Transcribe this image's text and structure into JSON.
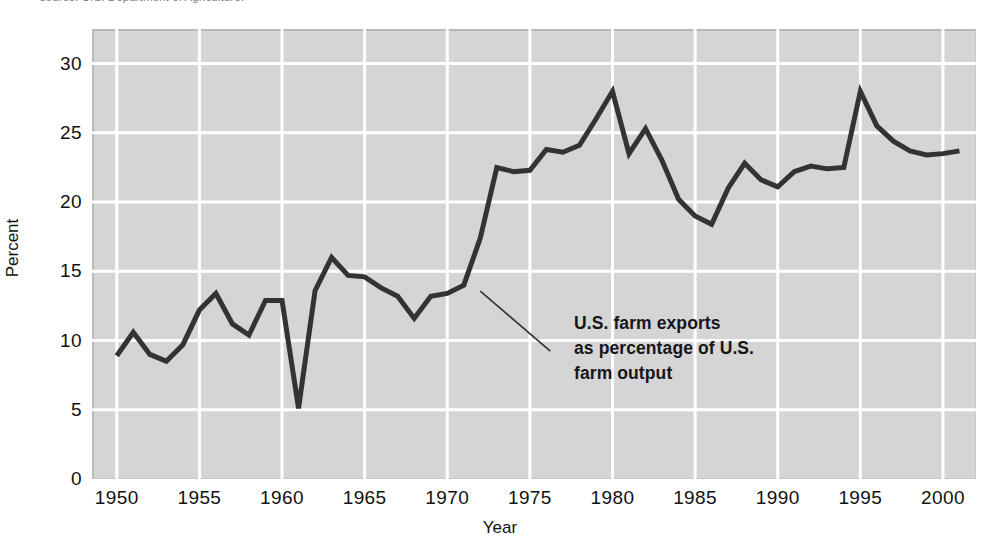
{
  "figure": {
    "caption_fragment": "source: U.S. Department of Agriculture."
  },
  "axes": {
    "y_title": "Percent",
    "x_title": "Year",
    "y_ticks": [
      "0",
      "5",
      "10",
      "15",
      "20",
      "25",
      "30"
    ],
    "x_ticks": [
      "1950",
      "1955",
      "1960",
      "1965",
      "1970",
      "1975",
      "1980",
      "1985",
      "1990",
      "1995",
      "2000"
    ]
  },
  "annotation": {
    "line1": "U.S. farm exports",
    "line2": "as percentage of U.S.",
    "line3": "farm output"
  },
  "style": {
    "plot_background": "#d5d5d5",
    "gridline_color": "#ffffff",
    "series_color": "#333333",
    "text_color": "#111111"
  },
  "chart_data": {
    "type": "line",
    "title": "U.S. farm exports as percentage of U.S. farm output",
    "xlabel": "Year",
    "ylabel": "Percent",
    "xlim": [
      1948.5,
      2002.0
    ],
    "ylim": [
      0,
      32.5
    ],
    "yticks": [
      0,
      5,
      10,
      15,
      20,
      25,
      30
    ],
    "xticks": [
      1950,
      1955,
      1960,
      1965,
      1970,
      1975,
      1980,
      1985,
      1990,
      1995,
      2000
    ],
    "grid": true,
    "legend": null,
    "series": [
      {
        "name": "U.S. farm exports as percentage of U.S. farm output",
        "color": "#333333",
        "x": [
          1950,
          1951,
          1952,
          1953,
          1954,
          1955,
          1956,
          1957,
          1958,
          1959,
          1960,
          1961,
          1962,
          1963,
          1964,
          1965,
          1966,
          1967,
          1968,
          1969,
          1970,
          1971,
          1972,
          1973,
          1974,
          1975,
          1976,
          1977,
          1978,
          1979,
          1980,
          1981,
          1982,
          1983,
          1984,
          1985,
          1986,
          1987,
          1988,
          1989,
          1990,
          1991,
          1992,
          1993,
          1994,
          1995,
          1996,
          1997,
          1998,
          1999,
          2000,
          2001
        ],
        "y": [
          8.9,
          10.6,
          9.0,
          8.5,
          9.7,
          12.2,
          13.4,
          11.2,
          10.4,
          12.9,
          12.9,
          5.1,
          13.6,
          16.0,
          14.7,
          14.6,
          13.8,
          13.2,
          11.6,
          13.2,
          13.4,
          14.0,
          17.4,
          22.5,
          22.2,
          22.3,
          23.8,
          23.6,
          24.1,
          26.0,
          28.0,
          23.5,
          25.3,
          23.0,
          20.2,
          19.0,
          18.4,
          21.0,
          22.8,
          21.6,
          21.1,
          22.2,
          22.6,
          22.4,
          22.5,
          28.0,
          25.5,
          24.4,
          23.7,
          23.4,
          23.5,
          23.7
        ]
      }
    ]
  }
}
